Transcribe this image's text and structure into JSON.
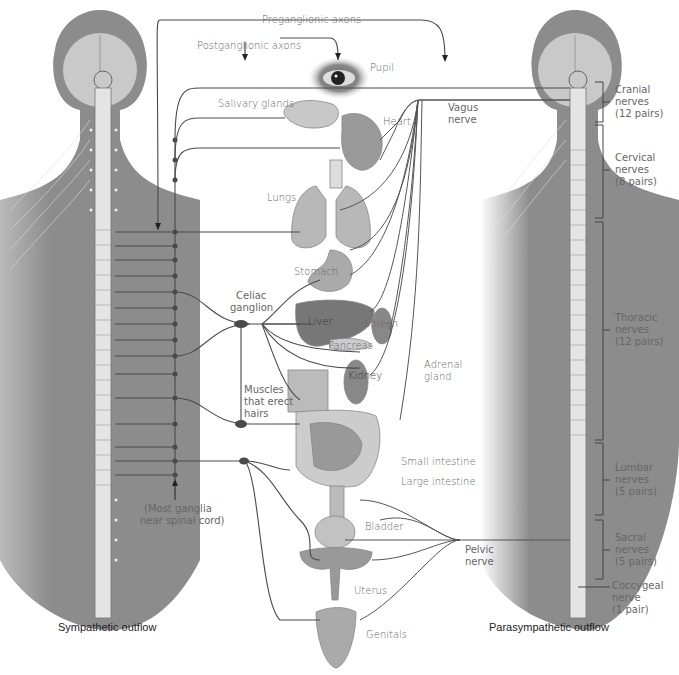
{
  "figure": {
    "captions": {
      "left": "Sympathetic outflow",
      "right": "Parasympathetic outflow"
    },
    "axon_labels": {
      "preganglionic": "Preganglionic axons",
      "postganglionic": "Postganglionic axons"
    },
    "organs": [
      {
        "id": "pupil",
        "label": "Pupil"
      },
      {
        "id": "salivary",
        "label": "Salivary glands"
      },
      {
        "id": "heart",
        "label": "Heart"
      },
      {
        "id": "lungs",
        "label": "Lungs"
      },
      {
        "id": "stomach",
        "label": "Stomach"
      },
      {
        "id": "liver",
        "label": "Liver"
      },
      {
        "id": "spleen",
        "label": "Spleen"
      },
      {
        "id": "pancreas",
        "label": "Pancreas"
      },
      {
        "id": "kidney",
        "label": "Kidney"
      },
      {
        "id": "adrenal",
        "label": "Adrenal gland"
      },
      {
        "id": "small_intestine",
        "label": "Small intestine"
      },
      {
        "id": "large_intestine",
        "label": "Large intestine"
      },
      {
        "id": "bladder",
        "label": "Bladder"
      },
      {
        "id": "uterus",
        "label": "Uterus"
      },
      {
        "id": "genitals",
        "label": "Genitals"
      }
    ],
    "structures": {
      "vagus": [
        "Vagus",
        "nerve"
      ],
      "celiac": [
        "Celiac",
        "ganglion"
      ],
      "muscles_hairs": [
        "Muscles",
        "that erect",
        "hairs"
      ],
      "pelvic": [
        "Pelvic",
        "nerve"
      ],
      "ganglia_note": [
        "(Most ganglia",
        "near spinal cord)"
      ]
    },
    "spinal_segments": [
      {
        "name": "Cranial",
        "line2": "nerves",
        "count": "(12 pairs)"
      },
      {
        "name": "Cervical",
        "line2": "nerves",
        "count": "(8 pairs)"
      },
      {
        "name": "Thoracic",
        "line2": "nerves",
        "count": "(12 pairs)"
      },
      {
        "name": "Lumbar",
        "line2": "nerves",
        "count": "(5 pairs)"
      },
      {
        "name": "Sacral",
        "line2": "nerves",
        "count": "(5 pairs)"
      },
      {
        "name": "Coccygeal",
        "line2": "nerve",
        "count": "(1 pair)"
      }
    ],
    "colors": {
      "body": "#8c8c8c",
      "brain": "#c9c9c9",
      "spine": "#e4e4e4",
      "nerve": "#4a4a4a",
      "organ": "#a8a8a8",
      "label": "#666666"
    }
  }
}
